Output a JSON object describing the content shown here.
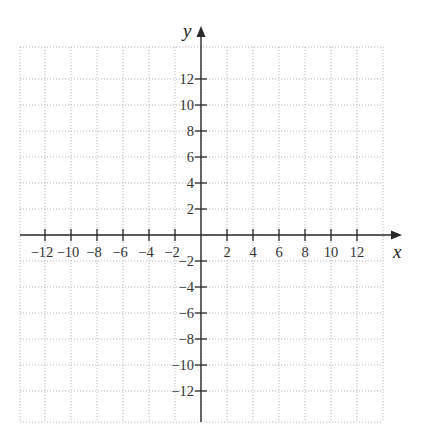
{
  "chart_data": {
    "type": "scatter",
    "title": "",
    "xlabel": "x",
    "ylabel": "y",
    "xlim": [
      -14,
      14
    ],
    "ylim": [
      -14,
      14
    ],
    "grid": true,
    "grid_step": 2,
    "x_ticks": [
      -12,
      -10,
      -8,
      -6,
      -4,
      -2,
      2,
      4,
      6,
      8,
      10,
      12
    ],
    "y_ticks": [
      -12,
      -10,
      -8,
      -6,
      -4,
      -2,
      2,
      4,
      6,
      8,
      10,
      12
    ],
    "x_tick_labels": [
      "−12",
      "−10",
      "−8",
      "−6",
      "−4",
      "−2",
      "2",
      "4",
      "6",
      "8",
      "10",
      "12"
    ],
    "y_tick_labels": [
      "−12",
      "−10",
      "−8",
      "−6",
      "−4",
      "−2",
      "2",
      "4",
      "6",
      "8",
      "10",
      "12"
    ],
    "series": [],
    "legend": null
  },
  "layout": {
    "origin_px": [
      201,
      235
    ],
    "px_per_unit": 13,
    "grid_left": 20,
    "grid_right": 383,
    "grid_top": 47,
    "grid_bottom": 422,
    "x_axis_start": 20,
    "x_axis_end": 402,
    "y_axis_top": 26,
    "y_axis_bottom": 422,
    "colors": {
      "axis": "#2a2a2a",
      "grid": "#b8b8b8",
      "label": "#333333"
    }
  }
}
